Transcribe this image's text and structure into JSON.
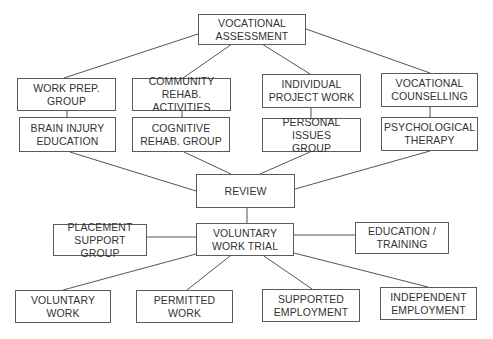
{
  "diagram": {
    "nodes": {
      "vocational_assessment": "VOCATIONAL\nASSESSMENT",
      "work_prep_group": "WORK PREP.\nGROUP",
      "community_rehab_activities": "COMMUNITY\nREHAB.  ACTIVITIES",
      "individual_project_work": "INDIVIDUAL\nPROJECT WORK",
      "vocational_counselling": "VOCATIONAL\nCOUNSELLING",
      "brain_injury_education": "BRAIN INJURY\nEDUCATION",
      "cognitive_rehab_group": "COGNITIVE\nREHAB. GROUP",
      "personal_issues_group": "PERSONAL ISSUES\nGROUP",
      "psychological_therapy": "PSYCHOLOGICAL\nTHERAPY",
      "review": "REVIEW",
      "voluntary_work_trial": "VOLUNTARY\nWORK TRIAL",
      "placement_support_group": "PLACEMENT\nSUPPORT  GROUP",
      "education_training": "EDUCATION /\nTRAINING",
      "voluntary_work": "VOLUNTARY\nWORK",
      "permitted_work": "PERMITTED\nWORK",
      "supported_employment": "SUPPORTED\nEMPLOYMENT",
      "independent_employment": "INDEPENDENT\nEMPLOYMENT"
    },
    "edges": [
      [
        "vocational_assessment",
        "work_prep_group"
      ],
      [
        "vocational_assessment",
        "community_rehab_activities"
      ],
      [
        "vocational_assessment",
        "individual_project_work"
      ],
      [
        "vocational_assessment",
        "vocational_counselling"
      ],
      [
        "work_prep_group",
        "brain_injury_education"
      ],
      [
        "community_rehab_activities",
        "cognitive_rehab_group"
      ],
      [
        "individual_project_work",
        "personal_issues_group"
      ],
      [
        "vocational_counselling",
        "psychological_therapy"
      ],
      [
        "brain_injury_education",
        "review"
      ],
      [
        "cognitive_rehab_group",
        "review"
      ],
      [
        "personal_issues_group",
        "review"
      ],
      [
        "psychological_therapy",
        "review"
      ],
      [
        "review",
        "voluntary_work_trial"
      ],
      [
        "placement_support_group",
        "voluntary_work_trial"
      ],
      [
        "voluntary_work_trial",
        "education_training"
      ],
      [
        "voluntary_work_trial",
        "voluntary_work"
      ],
      [
        "voluntary_work_trial",
        "permitted_work"
      ],
      [
        "voluntary_work_trial",
        "supported_employment"
      ],
      [
        "voluntary_work_trial",
        "independent_employment"
      ]
    ]
  }
}
